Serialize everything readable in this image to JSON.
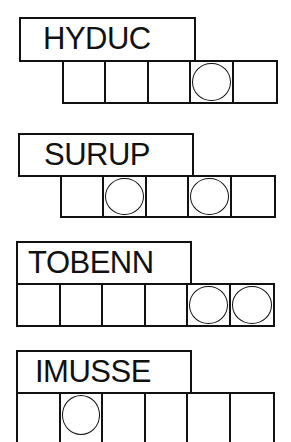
{
  "puzzles": [
    {
      "scrambled": "HYDUC",
      "cells": 5,
      "circled": [
        4
      ]
    },
    {
      "scrambled": "SURUP",
      "cells": 5,
      "circled": [
        2,
        4
      ]
    },
    {
      "scrambled": "TOBENN",
      "cells": 6,
      "circled": [
        5,
        6
      ]
    },
    {
      "scrambled": "IMUSSE",
      "cells": 6,
      "circled": [
        2
      ]
    }
  ]
}
